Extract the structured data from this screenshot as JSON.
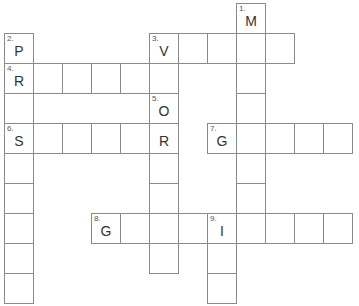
{
  "puzzle": {
    "cell_size": 29,
    "origin": {
      "x": 4,
      "y": 3
    },
    "cells": [
      {
        "r": 0,
        "c": 8,
        "num": "1.",
        "letter": "M"
      },
      {
        "r": 1,
        "c": 8
      },
      {
        "r": 2,
        "c": 8
      },
      {
        "r": 3,
        "c": 8
      },
      {
        "r": 4,
        "c": 8
      },
      {
        "r": 5,
        "c": 8
      },
      {
        "r": 6,
        "c": 8
      },
      {
        "r": 7,
        "c": 8
      },
      {
        "r": 1,
        "c": 0,
        "num": "2.",
        "letter": "P"
      },
      {
        "r": 2,
        "c": 0,
        "num": "4.",
        "letter": "R"
      },
      {
        "r": 3,
        "c": 0
      },
      {
        "r": 4,
        "c": 0,
        "num": "6.",
        "letter": "S"
      },
      {
        "r": 5,
        "c": 0
      },
      {
        "r": 6,
        "c": 0
      },
      {
        "r": 7,
        "c": 0
      },
      {
        "r": 8,
        "c": 0
      },
      {
        "r": 9,
        "c": 0
      },
      {
        "r": 1,
        "c": 5,
        "num": "3.",
        "letter": "V"
      },
      {
        "r": 1,
        "c": 6
      },
      {
        "r": 1,
        "c": 7
      },
      {
        "r": 1,
        "c": 9
      },
      {
        "r": 2,
        "c": 1
      },
      {
        "r": 2,
        "c": 2
      },
      {
        "r": 2,
        "c": 3
      },
      {
        "r": 2,
        "c": 4
      },
      {
        "r": 2,
        "c": 5
      },
      {
        "r": 3,
        "c": 5,
        "num": "5.",
        "letter": "O"
      },
      {
        "r": 4,
        "c": 5,
        "letter": "R"
      },
      {
        "r": 5,
        "c": 5
      },
      {
        "r": 6,
        "c": 5
      },
      {
        "r": 7,
        "c": 5
      },
      {
        "r": 8,
        "c": 5
      },
      {
        "r": 4,
        "c": 1
      },
      {
        "r": 4,
        "c": 2
      },
      {
        "r": 4,
        "c": 3
      },
      {
        "r": 4,
        "c": 4
      },
      {
        "r": 4,
        "c": 7,
        "num": "7.",
        "letter": "G"
      },
      {
        "r": 4,
        "c": 9
      },
      {
        "r": 4,
        "c": 10
      },
      {
        "r": 4,
        "c": 11
      },
      {
        "r": 7,
        "c": 3,
        "num": "8.",
        "letter": "G"
      },
      {
        "r": 7,
        "c": 4
      },
      {
        "r": 7,
        "c": 6
      },
      {
        "r": 7,
        "c": 7,
        "num": "9.",
        "letter": "I"
      },
      {
        "r": 7,
        "c": 9
      },
      {
        "r": 7,
        "c": 10
      },
      {
        "r": 7,
        "c": 11
      },
      {
        "r": 8,
        "c": 7
      },
      {
        "r": 9,
        "c": 7
      }
    ],
    "clues": {
      "across": [
        {
          "num": 3,
          "start_letter": "V",
          "length": 5
        },
        {
          "num": 4,
          "start_letter": "R",
          "length": 6
        },
        {
          "num": 6,
          "start_letter": "S",
          "length": 6
        },
        {
          "num": 7,
          "start_letter": "G",
          "length": 5
        },
        {
          "num": 8,
          "start_letter": "G",
          "length": 9
        }
      ],
      "down": [
        {
          "num": 1,
          "start_letter": "M",
          "length": 8
        },
        {
          "num": 2,
          "start_letter": "P",
          "length": 9
        },
        {
          "num": 5,
          "start_letter": "O",
          "length": 6
        },
        {
          "num": 9,
          "start_letter": "I",
          "length": 3
        }
      ]
    }
  }
}
